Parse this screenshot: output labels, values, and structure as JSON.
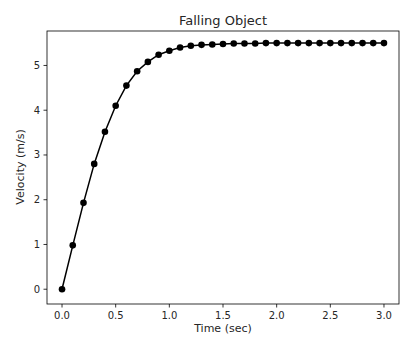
{
  "chart_data": {
    "type": "line",
    "title": "Falling Object",
    "xlabel": "Time (sec)",
    "ylabel": "Velocity (m/s)",
    "x": [
      0.0,
      0.1,
      0.2,
      0.3,
      0.4,
      0.5,
      0.6,
      0.7,
      0.8,
      0.9,
      1.0,
      1.1,
      1.2,
      1.3,
      1.4,
      1.5,
      1.6,
      1.7,
      1.8,
      1.9,
      2.0,
      2.1,
      2.2,
      2.3,
      2.4,
      2.5,
      2.6,
      2.7,
      2.8,
      2.9,
      3.0
    ],
    "series": [
      {
        "name": "velocity",
        "values": [
          0.0,
          0.98,
          1.93,
          2.8,
          3.52,
          4.1,
          4.55,
          4.87,
          5.08,
          5.24,
          5.33,
          5.4,
          5.44,
          5.46,
          5.47,
          5.48,
          5.49,
          5.49,
          5.49,
          5.5,
          5.5,
          5.5,
          5.5,
          5.5,
          5.5,
          5.5,
          5.5,
          5.5,
          5.5,
          5.5,
          5.5
        ],
        "marker": "circle",
        "color": "#000000"
      }
    ],
    "xticks": [
      0.0,
      0.5,
      1.0,
      1.5,
      2.0,
      2.5,
      3.0
    ],
    "xtick_labels": [
      "0.0",
      "0.5",
      "1.0",
      "1.5",
      "2.0",
      "2.5",
      "3.0"
    ],
    "yticks": [
      0,
      1,
      2,
      3,
      4,
      5
    ],
    "ytick_labels": [
      "0",
      "1",
      "2",
      "3",
      "4",
      "5"
    ],
    "xlim": [
      -0.14,
      3.14
    ],
    "ylim": [
      -0.33,
      5.77
    ],
    "grid": false,
    "legend": null
  }
}
